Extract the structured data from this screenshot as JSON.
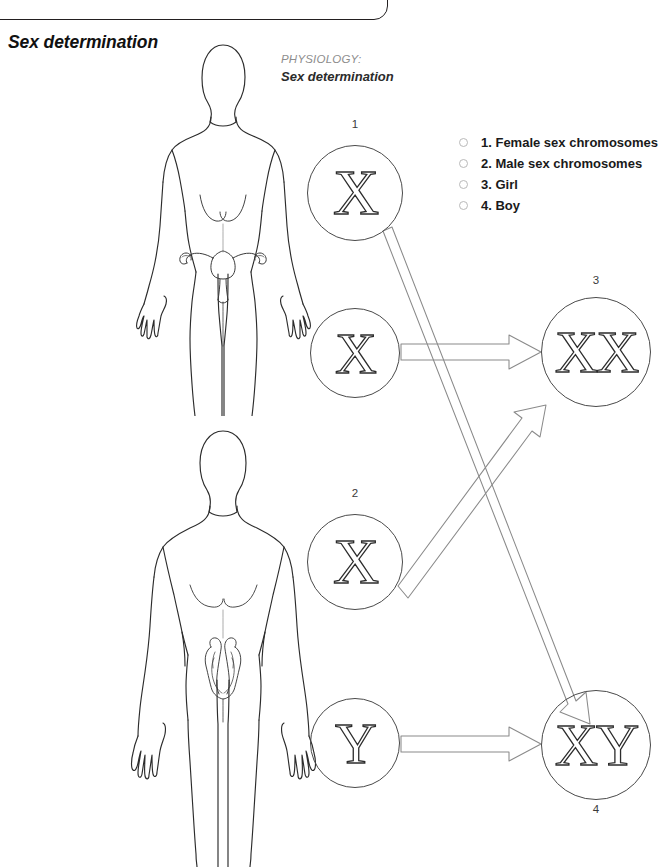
{
  "page": {
    "width": 671,
    "height": 867,
    "background": "#ffffff"
  },
  "section": {
    "heading": "Sex determination"
  },
  "caption": {
    "kicker": "PHYSIOLOGY:",
    "subject": "Sex determination"
  },
  "legend": {
    "items": [
      {
        "number": "1",
        "label": "1. Female sex chromosomes"
      },
      {
        "number": "2",
        "label": "2. Male sex chromosomes"
      },
      {
        "number": "3",
        "label": "3. Girl"
      },
      {
        "number": "4",
        "label": "4. Boy"
      }
    ]
  },
  "diagram": {
    "type": "punnett-inheritance",
    "parents": [
      {
        "sex": "female",
        "label": "female-body-figure"
      },
      {
        "sex": "male",
        "label": "male-body-figure"
      }
    ],
    "gametes": [
      {
        "id": "g1",
        "glyph": "X",
        "number": "1",
        "number_position": "above",
        "parent": "female",
        "cx": 355,
        "cy": 193,
        "r": 48
      },
      {
        "id": "g2",
        "glyph": "X",
        "number": "",
        "number_position": "none",
        "parent": "female",
        "cx": 355,
        "cy": 353,
        "r": 45
      },
      {
        "id": "g3",
        "glyph": "X",
        "number": "2",
        "number_position": "above",
        "parent": "male",
        "cx": 355,
        "cy": 562,
        "r": 48
      },
      {
        "id": "g4",
        "glyph": "Y",
        "number": "",
        "number_position": "none",
        "parent": "male",
        "cx": 355,
        "cy": 743,
        "r": 45
      }
    ],
    "offspring": [
      {
        "id": "o1",
        "glyph": "XX",
        "number": "3",
        "number_position": "above",
        "cx": 596,
        "cy": 352,
        "r": 55
      },
      {
        "id": "o2",
        "glyph": "XY",
        "number": "4",
        "number_position": "below",
        "cx": 596,
        "cy": 745,
        "r": 55
      }
    ],
    "arrows": [
      {
        "from": "g1",
        "to": "o2",
        "direction": "down-right"
      },
      {
        "from": "g2",
        "to": "o1",
        "direction": "right"
      },
      {
        "from": "g3",
        "to": "o1",
        "direction": "up-right"
      },
      {
        "from": "g4",
        "to": "o2",
        "direction": "right"
      }
    ],
    "colors": {
      "outline": "#2c2c2c",
      "circle_stroke": "#4a4a4a",
      "arrow_stroke": "#8a8a8a",
      "legend_bullet": "#b9b9b9",
      "kicker_text": "#8d8d8d"
    }
  }
}
